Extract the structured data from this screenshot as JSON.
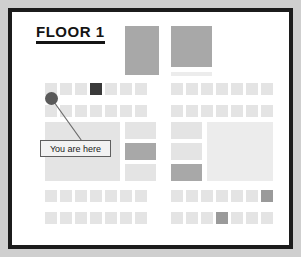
{
  "map": {
    "title": "FLOOR 1",
    "marker_label": "You are here",
    "colors": {
      "page_background": "#cfcfcf",
      "frame_border": "#1c1c1c",
      "canvas_background": "#ffffff",
      "unit_light": "#e4e4e4",
      "unit_pale": "#ececec",
      "unit_medium": "#a8a8a8",
      "unit_dark": "#3a3a3a",
      "unit_accent": "#9a9a9a",
      "marker_dot": "#5a5a5a",
      "leader_line": "#6a6a6a",
      "label_fill": "#f2f2f2",
      "label_border": "#5f5f5f",
      "title_text": "#141414"
    },
    "marker": {
      "dot_x": 33,
      "dot_y": 80,
      "label_x": 28,
      "label_y": 128,
      "label_w": 71,
      "label_h": 17
    },
    "units": [
      {
        "name": "anchor-block-left",
        "x": 113,
        "y": 14,
        "w": 34,
        "h": 49,
        "tone": "medium"
      },
      {
        "name": "anchor-block-right",
        "x": 159,
        "y": 14,
        "w": 41,
        "h": 41,
        "tone": "medium"
      },
      {
        "name": "corridor-bar-right",
        "x": 159,
        "y": 60,
        "w": 41,
        "h": 4,
        "tone": "pale"
      },
      {
        "name": "left-row1-cell1",
        "x": 33,
        "y": 71,
        "w": 12,
        "h": 12,
        "tone": "light"
      },
      {
        "name": "left-row1-cell2",
        "x": 48,
        "y": 71,
        "w": 12,
        "h": 12,
        "tone": "light"
      },
      {
        "name": "left-row1-cell3",
        "x": 63,
        "y": 71,
        "w": 12,
        "h": 12,
        "tone": "light"
      },
      {
        "name": "left-row1-cell4",
        "x": 78,
        "y": 71,
        "w": 12,
        "h": 12,
        "tone": "dark"
      },
      {
        "name": "left-row1-cell5",
        "x": 93,
        "y": 71,
        "w": 12,
        "h": 12,
        "tone": "light"
      },
      {
        "name": "left-row1-cell6",
        "x": 108,
        "y": 71,
        "w": 12,
        "h": 12,
        "tone": "light"
      },
      {
        "name": "left-row1-cell7",
        "x": 123,
        "y": 71,
        "w": 12,
        "h": 12,
        "tone": "light"
      },
      {
        "name": "right-row1-cell1",
        "x": 159,
        "y": 71,
        "w": 12,
        "h": 12,
        "tone": "light"
      },
      {
        "name": "right-row1-cell2",
        "x": 174,
        "y": 71,
        "w": 12,
        "h": 12,
        "tone": "light"
      },
      {
        "name": "right-row1-cell3",
        "x": 189,
        "y": 71,
        "w": 12,
        "h": 12,
        "tone": "light"
      },
      {
        "name": "right-row1-cell4",
        "x": 204,
        "y": 71,
        "w": 12,
        "h": 12,
        "tone": "light"
      },
      {
        "name": "right-row1-cell5",
        "x": 219,
        "y": 71,
        "w": 12,
        "h": 12,
        "tone": "light"
      },
      {
        "name": "right-row1-cell6",
        "x": 234,
        "y": 71,
        "w": 12,
        "h": 12,
        "tone": "light"
      },
      {
        "name": "right-row1-cell7",
        "x": 249,
        "y": 71,
        "w": 12,
        "h": 12,
        "tone": "light"
      },
      {
        "name": "left-row2-cell1",
        "x": 33,
        "y": 93,
        "w": 12,
        "h": 12,
        "tone": "light"
      },
      {
        "name": "left-row2-cell2",
        "x": 48,
        "y": 93,
        "w": 12,
        "h": 12,
        "tone": "light"
      },
      {
        "name": "left-row2-cell3",
        "x": 63,
        "y": 93,
        "w": 12,
        "h": 12,
        "tone": "light"
      },
      {
        "name": "left-row2-cell4",
        "x": 78,
        "y": 93,
        "w": 12,
        "h": 12,
        "tone": "light"
      },
      {
        "name": "left-row2-cell5",
        "x": 93,
        "y": 93,
        "w": 12,
        "h": 12,
        "tone": "light"
      },
      {
        "name": "left-row2-cell6",
        "x": 108,
        "y": 93,
        "w": 12,
        "h": 12,
        "tone": "light"
      },
      {
        "name": "left-row2-cell7",
        "x": 123,
        "y": 93,
        "w": 12,
        "h": 12,
        "tone": "light"
      },
      {
        "name": "right-row2-cell1",
        "x": 159,
        "y": 93,
        "w": 12,
        "h": 12,
        "tone": "light"
      },
      {
        "name": "right-row2-cell2",
        "x": 174,
        "y": 93,
        "w": 12,
        "h": 12,
        "tone": "light"
      },
      {
        "name": "right-row2-cell3",
        "x": 189,
        "y": 93,
        "w": 12,
        "h": 12,
        "tone": "light"
      },
      {
        "name": "right-row2-cell4",
        "x": 204,
        "y": 93,
        "w": 12,
        "h": 12,
        "tone": "light"
      },
      {
        "name": "right-row2-cell5",
        "x": 219,
        "y": 93,
        "w": 12,
        "h": 12,
        "tone": "light"
      },
      {
        "name": "right-row2-cell6",
        "x": 234,
        "y": 93,
        "w": 12,
        "h": 12,
        "tone": "light"
      },
      {
        "name": "right-row2-cell7",
        "x": 249,
        "y": 93,
        "w": 12,
        "h": 12,
        "tone": "light"
      },
      {
        "name": "left-hall-block",
        "x": 33,
        "y": 110,
        "w": 75,
        "h": 59,
        "tone": "light"
      },
      {
        "name": "mid-col-upper",
        "x": 113,
        "y": 110,
        "w": 31,
        "h": 17,
        "tone": "light"
      },
      {
        "name": "mid-col-center",
        "x": 113,
        "y": 131,
        "w": 31,
        "h": 17,
        "tone": "medium"
      },
      {
        "name": "mid-col-lower",
        "x": 113,
        "y": 152,
        "w": 31,
        "h": 17,
        "tone": "light"
      },
      {
        "name": "mid2-col-upper",
        "x": 159,
        "y": 110,
        "w": 31,
        "h": 17,
        "tone": "light"
      },
      {
        "name": "mid2-col-center",
        "x": 159,
        "y": 131,
        "w": 31,
        "h": 17,
        "tone": "light"
      },
      {
        "name": "mid2-col-lower",
        "x": 159,
        "y": 152,
        "w": 31,
        "h": 17,
        "tone": "medium"
      },
      {
        "name": "right-hall-block",
        "x": 195,
        "y": 110,
        "w": 66,
        "h": 59,
        "tone": "pale"
      },
      {
        "name": "left-row3-cell1",
        "x": 33,
        "y": 178,
        "w": 12,
        "h": 12,
        "tone": "light"
      },
      {
        "name": "left-row3-cell2",
        "x": 48,
        "y": 178,
        "w": 12,
        "h": 12,
        "tone": "light"
      },
      {
        "name": "left-row3-cell3",
        "x": 63,
        "y": 178,
        "w": 12,
        "h": 12,
        "tone": "light"
      },
      {
        "name": "left-row3-cell4",
        "x": 78,
        "y": 178,
        "w": 12,
        "h": 12,
        "tone": "light"
      },
      {
        "name": "left-row3-cell5",
        "x": 93,
        "y": 178,
        "w": 12,
        "h": 12,
        "tone": "light"
      },
      {
        "name": "left-row3-cell6",
        "x": 108,
        "y": 178,
        "w": 12,
        "h": 12,
        "tone": "light"
      },
      {
        "name": "left-row3-cell7",
        "x": 123,
        "y": 178,
        "w": 12,
        "h": 12,
        "tone": "light"
      },
      {
        "name": "right-row3-cell1",
        "x": 159,
        "y": 178,
        "w": 12,
        "h": 12,
        "tone": "light"
      },
      {
        "name": "right-row3-cell2",
        "x": 174,
        "y": 178,
        "w": 12,
        "h": 12,
        "tone": "light"
      },
      {
        "name": "right-row3-cell3",
        "x": 189,
        "y": 178,
        "w": 12,
        "h": 12,
        "tone": "light"
      },
      {
        "name": "right-row3-cell4",
        "x": 204,
        "y": 178,
        "w": 12,
        "h": 12,
        "tone": "light"
      },
      {
        "name": "right-row3-cell5",
        "x": 219,
        "y": 178,
        "w": 12,
        "h": 12,
        "tone": "light"
      },
      {
        "name": "right-row3-cell6",
        "x": 234,
        "y": 178,
        "w": 12,
        "h": 12,
        "tone": "light"
      },
      {
        "name": "right-row3-cell7",
        "x": 249,
        "y": 178,
        "w": 12,
        "h": 12,
        "tone": "accent"
      },
      {
        "name": "left-row4-cell1",
        "x": 33,
        "y": 200,
        "w": 12,
        "h": 12,
        "tone": "light"
      },
      {
        "name": "left-row4-cell2",
        "x": 48,
        "y": 200,
        "w": 12,
        "h": 12,
        "tone": "light"
      },
      {
        "name": "left-row4-cell3",
        "x": 63,
        "y": 200,
        "w": 12,
        "h": 12,
        "tone": "light"
      },
      {
        "name": "left-row4-cell4",
        "x": 78,
        "y": 200,
        "w": 12,
        "h": 12,
        "tone": "light"
      },
      {
        "name": "left-row4-cell5",
        "x": 93,
        "y": 200,
        "w": 12,
        "h": 12,
        "tone": "light"
      },
      {
        "name": "left-row4-cell6",
        "x": 108,
        "y": 200,
        "w": 12,
        "h": 12,
        "tone": "light"
      },
      {
        "name": "left-row4-cell7",
        "x": 123,
        "y": 200,
        "w": 12,
        "h": 12,
        "tone": "light"
      },
      {
        "name": "right-row4-cell1",
        "x": 159,
        "y": 200,
        "w": 12,
        "h": 12,
        "tone": "light"
      },
      {
        "name": "right-row4-cell2",
        "x": 174,
        "y": 200,
        "w": 12,
        "h": 12,
        "tone": "light"
      },
      {
        "name": "right-row4-cell3",
        "x": 189,
        "y": 200,
        "w": 12,
        "h": 12,
        "tone": "light"
      },
      {
        "name": "right-row4-cell4",
        "x": 204,
        "y": 200,
        "w": 12,
        "h": 12,
        "tone": "accent"
      },
      {
        "name": "right-row4-cell5",
        "x": 219,
        "y": 200,
        "w": 12,
        "h": 12,
        "tone": "light"
      },
      {
        "name": "right-row4-cell6",
        "x": 234,
        "y": 200,
        "w": 12,
        "h": 12,
        "tone": "light"
      },
      {
        "name": "right-row4-cell7",
        "x": 249,
        "y": 200,
        "w": 12,
        "h": 12,
        "tone": "light"
      }
    ]
  }
}
